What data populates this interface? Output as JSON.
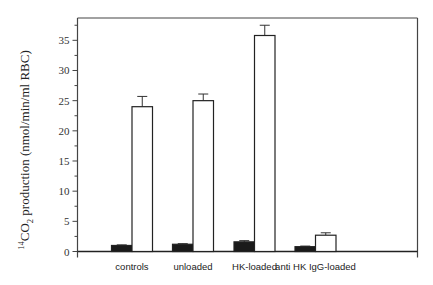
{
  "chart_data": {
    "type": "bar",
    "title": "",
    "xlabel": "",
    "ylabel": "14CO2 production (nmol/min/ml RBC)",
    "ylabel_parts": {
      "superscript": "14",
      "main": "CO",
      "subscript": "2",
      "rest": " production (nmol/min/ml RBC)"
    },
    "categories": [
      "controls",
      "unloaded",
      "HK-loaded",
      "anti HK IgG-loaded"
    ],
    "series": [
      {
        "name": "black bars",
        "color": "#1a1a1a",
        "values": [
          1.0,
          1.2,
          1.6,
          0.8
        ],
        "errors": [
          0.1,
          0.1,
          0.2,
          0.1
        ]
      },
      {
        "name": "white bars",
        "color": "#ffffff",
        "values": [
          24.0,
          25.0,
          35.8,
          2.7
        ],
        "errors": [
          1.7,
          1.1,
          1.7,
          0.4
        ]
      }
    ],
    "ylim": [
      0,
      38.7
    ],
    "yticks": [
      0,
      5,
      10,
      15,
      20,
      25,
      30,
      35
    ],
    "yminor_step": 2.5,
    "grid": false,
    "legend": "none"
  }
}
